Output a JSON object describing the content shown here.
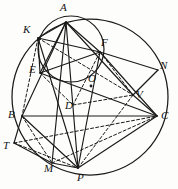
{
  "figure": {
    "stroke_color": "#1a1a1a",
    "label_color": "#141414",
    "background_color": "#fdfdfc",
    "width": 178,
    "height": 189,
    "main_circle": {
      "cx": 90,
      "cy": 97,
      "r": 78,
      "name": "main-circumcircle"
    },
    "inner_circle": {
      "cx": 71,
      "cy": 49,
      "r": 33,
      "name": "inner-circle"
    },
    "center_dot": {
      "cx": 91,
      "cy": 86,
      "r": 1.4,
      "name": "center-point-O"
    },
    "points": [
      {
        "id": "A",
        "label": "A",
        "x": 66,
        "y": 22,
        "lx": 60,
        "ly": 2
      },
      {
        "id": "K",
        "label": "K",
        "x": 38,
        "y": 38,
        "lx": 23,
        "ly": 24
      },
      {
        "id": "F",
        "label": "F",
        "x": 100,
        "y": 52,
        "lx": 101,
        "ly": 37
      },
      {
        "id": "N",
        "label": "N",
        "x": 158,
        "y": 70,
        "lx": 160,
        "ly": 60
      },
      {
        "id": "E",
        "label": "E",
        "x": 40,
        "y": 73,
        "lx": 29,
        "ly": 64
      },
      {
        "id": "O",
        "label": "O",
        "x": 91,
        "y": 86,
        "lx": 88,
        "ly": 73
      },
      {
        "id": "D",
        "label": "D",
        "x": 73,
        "y": 105,
        "lx": 65,
        "ly": 100
      },
      {
        "id": "V",
        "label": "V",
        "x": 133,
        "y": 95,
        "lx": 136,
        "ly": 89
      },
      {
        "id": "B",
        "label": "B",
        "x": 22,
        "y": 116,
        "lx": 8,
        "ly": 109
      },
      {
        "id": "C",
        "label": "C",
        "x": 157,
        "y": 116,
        "lx": 161,
        "ly": 110
      },
      {
        "id": "T",
        "label": "T",
        "x": 14,
        "y": 143,
        "lx": 3,
        "ly": 140
      },
      {
        "id": "M",
        "label": "M",
        "x": 52,
        "y": 163,
        "lx": 44,
        "ly": 163
      },
      {
        "id": "P",
        "label": "P",
        "x": 78,
        "y": 168,
        "lx": 77,
        "ly": 172
      }
    ],
    "solid_segments": [
      {
        "name": "segment-A-B",
        "from": "A",
        "to": "B"
      },
      {
        "name": "segment-A-E",
        "from": "A",
        "to": "E"
      },
      {
        "name": "segment-A-K",
        "from": "A",
        "to": "K"
      },
      {
        "name": "segment-A-F",
        "from": "A",
        "to": "F"
      },
      {
        "name": "segment-A-P",
        "from": "A",
        "to": "P"
      },
      {
        "name": "segment-A-M",
        "from": "A",
        "to": "M"
      },
      {
        "name": "segment-A-V",
        "from": "A",
        "to": "V"
      },
      {
        "name": "segment-K-E",
        "from": "K",
        "to": "E"
      },
      {
        "name": "segment-K-F",
        "from": "K",
        "to": "F"
      },
      {
        "name": "segment-K-P",
        "from": "K",
        "to": "P"
      },
      {
        "name": "segment-E-F",
        "from": "E",
        "to": "F"
      },
      {
        "name": "segment-E-C",
        "from": "E",
        "to": "C"
      },
      {
        "name": "segment-F-N",
        "from": "F",
        "to": "N"
      },
      {
        "name": "segment-F-C",
        "from": "F",
        "to": "C"
      },
      {
        "name": "segment-F-P",
        "from": "F",
        "to": "P"
      },
      {
        "name": "segment-N-V",
        "from": "N",
        "to": "V"
      },
      {
        "name": "segment-B-C",
        "from": "B",
        "to": "C"
      },
      {
        "name": "segment-B-T",
        "from": "B",
        "to": "T"
      },
      {
        "name": "segment-B-P",
        "from": "B",
        "to": "P"
      },
      {
        "name": "segment-T-M",
        "from": "T",
        "to": "M"
      },
      {
        "name": "segment-M-P",
        "from": "M",
        "to": "P"
      },
      {
        "name": "segment-P-C",
        "from": "P",
        "to": "C"
      },
      {
        "name": "segment-V-C",
        "from": "V",
        "to": "C"
      }
    ],
    "dashed_segments": [
      {
        "name": "dashed-K-B",
        "from": "K",
        "to": "B"
      },
      {
        "name": "dashed-K-V",
        "from": "K",
        "to": "V"
      },
      {
        "name": "dashed-E-D",
        "from": "E",
        "to": "D"
      },
      {
        "name": "dashed-F-D",
        "from": "F",
        "to": "D"
      },
      {
        "name": "dashed-D-V",
        "from": "D",
        "to": "V"
      },
      {
        "name": "dashed-F-V",
        "from": "F",
        "to": "V"
      },
      {
        "name": "dashed-T-C",
        "from": "T",
        "to": "C"
      },
      {
        "name": "dashed-T-P",
        "from": "T",
        "to": "P"
      },
      {
        "name": "dashed-B-M",
        "from": "B",
        "to": "M"
      },
      {
        "name": "dashed-M-C",
        "from": "M",
        "to": "C"
      },
      {
        "name": "dashed-P-V",
        "from": "P",
        "to": "V"
      }
    ]
  }
}
